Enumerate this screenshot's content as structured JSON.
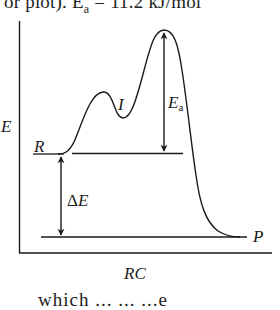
{
  "caption": {
    "top_text": "or plot). E",
    "top_sub": "a",
    "top_rest": " = 11.2 kJ/mol",
    "bottom_text": "which ... ... ...e"
  },
  "diagram": {
    "type": "reaction-energy-profile",
    "y_axis_label": "E",
    "x_axis_label": "RC",
    "labels": {
      "reactant": "R",
      "intermediate": "I",
      "product": "P",
      "activation_energy_main": "E",
      "activation_energy_sub": "a",
      "delta_e_symbol": "Δ",
      "delta_e_letter": "E"
    },
    "annotations": [
      {
        "name": "Ea",
        "description": "double arrow from reactant reference line up to highest transition state"
      },
      {
        "name": "ΔE",
        "description": "double arrow from reactant level down to product level"
      }
    ],
    "colors": {
      "line": "#1a1a1a",
      "background": "#ffffff"
    }
  }
}
